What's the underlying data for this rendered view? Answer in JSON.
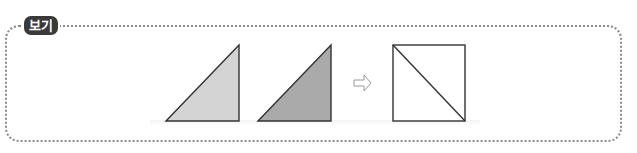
{
  "label": {
    "text": "보기"
  },
  "figures": {
    "triangle_light": {
      "fill": "#d4d4d4",
      "stroke": "#333333"
    },
    "triangle_dark": {
      "fill": "#aaaaaa",
      "stroke": "#333333"
    },
    "arrow": {
      "symbol": "⇨",
      "color": "#9a9a9a"
    },
    "square_with_diagonal": {
      "fill": "#ffffff",
      "stroke": "#333333"
    }
  },
  "colors": {
    "border": "#8a8a8a",
    "label_bg": "#3a3a3a",
    "label_text": "#ffffff"
  }
}
